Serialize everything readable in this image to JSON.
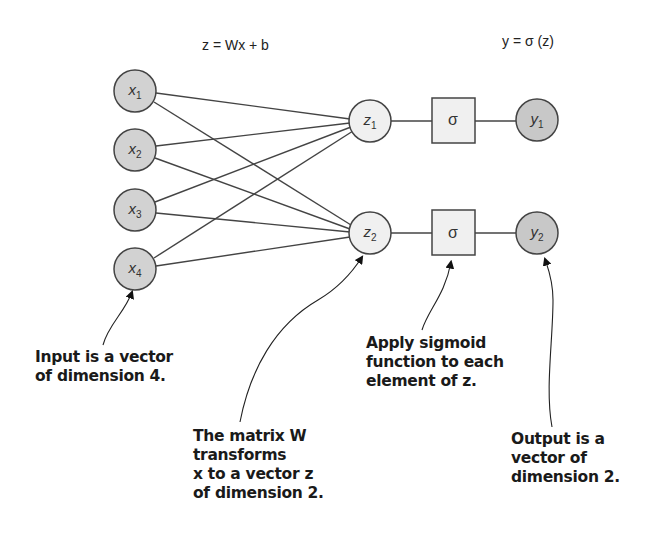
{
  "formulas": {
    "linear": "z = Wx + b",
    "activation": "y = σ (z)"
  },
  "inputs": [
    {
      "base": "x",
      "sub": "1"
    },
    {
      "base": "x",
      "sub": "2"
    },
    {
      "base": "x",
      "sub": "3"
    },
    {
      "base": "x",
      "sub": "4"
    }
  ],
  "hidden": [
    {
      "base": "z",
      "sub": "1"
    },
    {
      "base": "z",
      "sub": "2"
    }
  ],
  "activations": [
    {
      "symbol": "σ"
    },
    {
      "symbol": "σ"
    }
  ],
  "outputs": [
    {
      "base": "y",
      "sub": "1"
    },
    {
      "base": "y",
      "sub": "2"
    }
  ],
  "annotations": {
    "input": [
      "Input is a vector",
      "of dimension 4."
    ],
    "matrix": [
      "The matrix W",
      "transforms",
      "x to a vector z",
      "of dimension 2."
    ],
    "sigmoid": [
      "Apply sigmoid",
      "function to each",
      "element of z."
    ],
    "output": [
      "Output is a",
      "vector of",
      "dimension 2."
    ]
  },
  "colors": {
    "input_fill": "#d2d2d2",
    "hidden_fill": "#f0f0f0",
    "output_fill": "#c8c8c8",
    "stroke": "#444444"
  }
}
